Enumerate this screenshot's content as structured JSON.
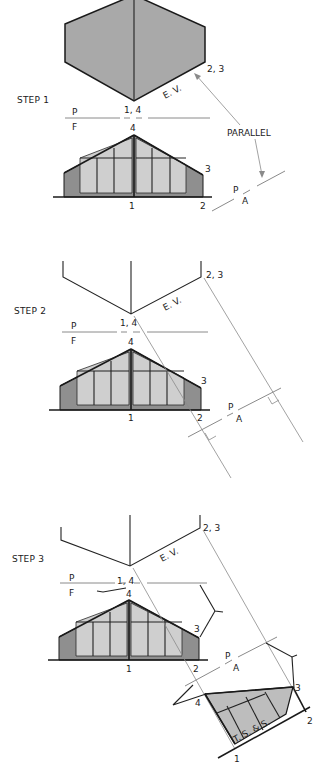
{
  "figure": {
    "step1": {
      "title": "STEP 1",
      "labels": {
        "top_1_4": "1, 4",
        "top_2_3": "2, 3",
        "ev": "E. V.",
        "fold_p": "P",
        "fold_f": "F",
        "front_4": "4",
        "front_3": "3",
        "front_1": "1",
        "front_2": "2",
        "aux_p": "P",
        "aux_a": "A",
        "parallel": "PARALLEL"
      }
    },
    "step2": {
      "title": "STEP 2",
      "labels": {
        "top_1_4": "1, 4",
        "top_2_3": "2, 3",
        "ev": "E. V.",
        "fold_p": "P",
        "fold_f": "F",
        "front_4": "4",
        "front_3": "3",
        "front_1": "1",
        "front_2": "2",
        "aux_p": "P",
        "aux_a": "A"
      }
    },
    "step3": {
      "title": "STEP 3",
      "labels": {
        "top_1_4": "1, 4",
        "top_2_3": "2, 3",
        "ev": "E. V.",
        "fold_p": "P",
        "fold_f": "F",
        "front_4": "4",
        "front_3": "3",
        "front_1": "1",
        "front_2": "2",
        "aux_p": "P",
        "aux_a": "A",
        "aux_4": "4",
        "aux_3": "3",
        "aux_2": "2",
        "aux_1": "1",
        "true_size": "T. S. & S."
      }
    },
    "colors": {
      "line": "#1a1a1a",
      "construction": "#8a8a8a",
      "roof_fill": "#a9a9a9",
      "wall_fill": "#8f8f8f",
      "glass_fill": "#cfcfcf"
    }
  }
}
